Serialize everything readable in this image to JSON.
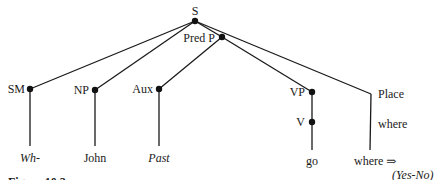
{
  "diagram": {
    "type": "syntax-tree",
    "caption": "Figure 10.3",
    "nodes": {
      "s": {
        "label": "S"
      },
      "pred_p": {
        "label": "Pred P"
      },
      "sm": {
        "label": "SM"
      },
      "np": {
        "label": "NP"
      },
      "aux": {
        "label": "Aux"
      },
      "vp": {
        "label": "VP"
      },
      "v": {
        "label": "V"
      },
      "place": {
        "label": "Place"
      },
      "place_word": {
        "label": "where"
      }
    },
    "leaves": {
      "wh": {
        "label": "Wh-",
        "italic": true
      },
      "john": {
        "label": "John",
        "italic": false
      },
      "past": {
        "label": "Past",
        "italic": true
      },
      "go": {
        "label": "go",
        "italic": false
      },
      "where": {
        "label": "where ⇒",
        "italic": false
      },
      "yes_no": {
        "label": "(Yes-No)",
        "italic": true
      }
    },
    "edges": [
      [
        "S",
        "SM"
      ],
      [
        "S",
        "NP"
      ],
      [
        "S",
        "Pred P"
      ],
      [
        "S",
        "Place"
      ],
      [
        "Pred P",
        "Aux"
      ],
      [
        "Pred P",
        "VP"
      ],
      [
        "SM",
        "Wh-"
      ],
      [
        "NP",
        "John"
      ],
      [
        "Aux",
        "Past"
      ],
      [
        "VP",
        "V"
      ],
      [
        "V",
        "go"
      ],
      [
        "Place",
        "where"
      ]
    ]
  }
}
